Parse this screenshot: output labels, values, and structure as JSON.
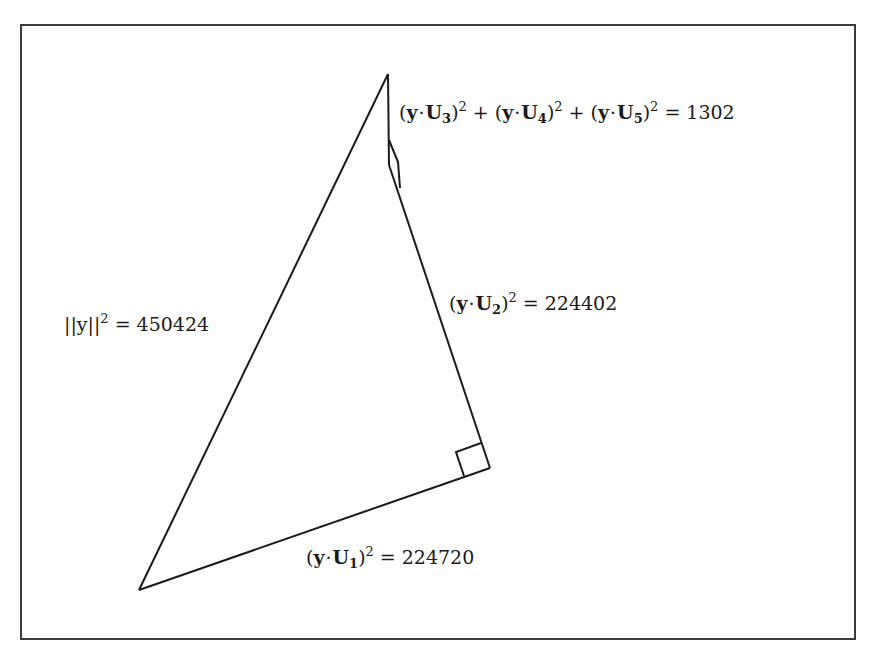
{
  "diagram": {
    "type": "right-triangle decomposition",
    "colors": {
      "line": "#1a1a1a",
      "frame": "#3a3a3a",
      "background": "#ffffff"
    },
    "vertices": {
      "apex": [
        388,
        74
      ],
      "bottom_left": [
        139,
        590
      ],
      "right_angle_vertex": [
        490,
        468
      ]
    },
    "labels": {
      "hypotenuse": {
        "lhs": "||y||",
        "exp": "2",
        "eq": "=",
        "value": "450424"
      },
      "u1": {
        "open": "(",
        "y": "y",
        "dot": "·",
        "U": "U",
        "sub": "1",
        "close": ")",
        "exp": "2",
        "eq": "=",
        "value": "224720"
      },
      "u2": {
        "open": "(",
        "y": "y",
        "dot": "·",
        "U": "U",
        "sub": "2",
        "close": ")",
        "exp": "2",
        "eq": "=",
        "value": "224402"
      },
      "rest": {
        "terms": [
          {
            "open": "(",
            "y": "y",
            "dot": "·",
            "U": "U",
            "sub": "3",
            "close": ")",
            "exp": "2"
          },
          {
            "open": "(",
            "y": "y",
            "dot": "·",
            "U": "U",
            "sub": "4",
            "close": ")",
            "exp": "2"
          },
          {
            "open": "(",
            "y": "y",
            "dot": "·",
            "U": "U",
            "sub": "5",
            "close": ")",
            "exp": "2"
          }
        ],
        "plus": "+",
        "eq": "=",
        "value": "1302"
      }
    }
  }
}
